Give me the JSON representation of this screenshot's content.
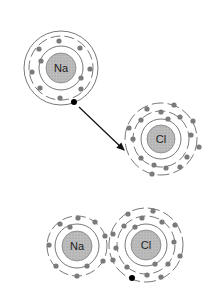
{
  "diagram": {
    "colors": {
      "nucleus_fill": "#b5b5b5",
      "electron": "#7a7a7a",
      "transferred_electron": "#000000",
      "shell_line": "#444444",
      "arrow": "#111111"
    },
    "atoms": [
      {
        "id": "na-top",
        "label": "Na",
        "cx": 61,
        "cy": 68,
        "nucleus_r": 15,
        "shells": [
          22,
          30,
          37
        ]
      },
      {
        "id": "cl-top",
        "label": "Cl",
        "cx": 161,
        "cy": 139,
        "nucleus_r": 14,
        "shells": [
          21,
          28,
          36
        ]
      },
      {
        "id": "na-bottom",
        "label": "Na",
        "cx": 77,
        "cy": 246,
        "nucleus_r": 15,
        "shells": [
          22,
          30
        ]
      },
      {
        "id": "cl-bottom",
        "label": "Cl",
        "cx": 146,
        "cy": 245,
        "nucleus_r": 15,
        "shells": [
          22,
          30,
          37
        ]
      }
    ],
    "labels": {
      "na_top": "Na",
      "cl_top": "Cl",
      "na_bottom": "Na",
      "cl_bottom": "Cl"
    },
    "transfer": {
      "from": [
        74,
        102
      ],
      "to": [
        126,
        152
      ],
      "description": "Electron transferred from Na outer shell to Cl"
    }
  }
}
